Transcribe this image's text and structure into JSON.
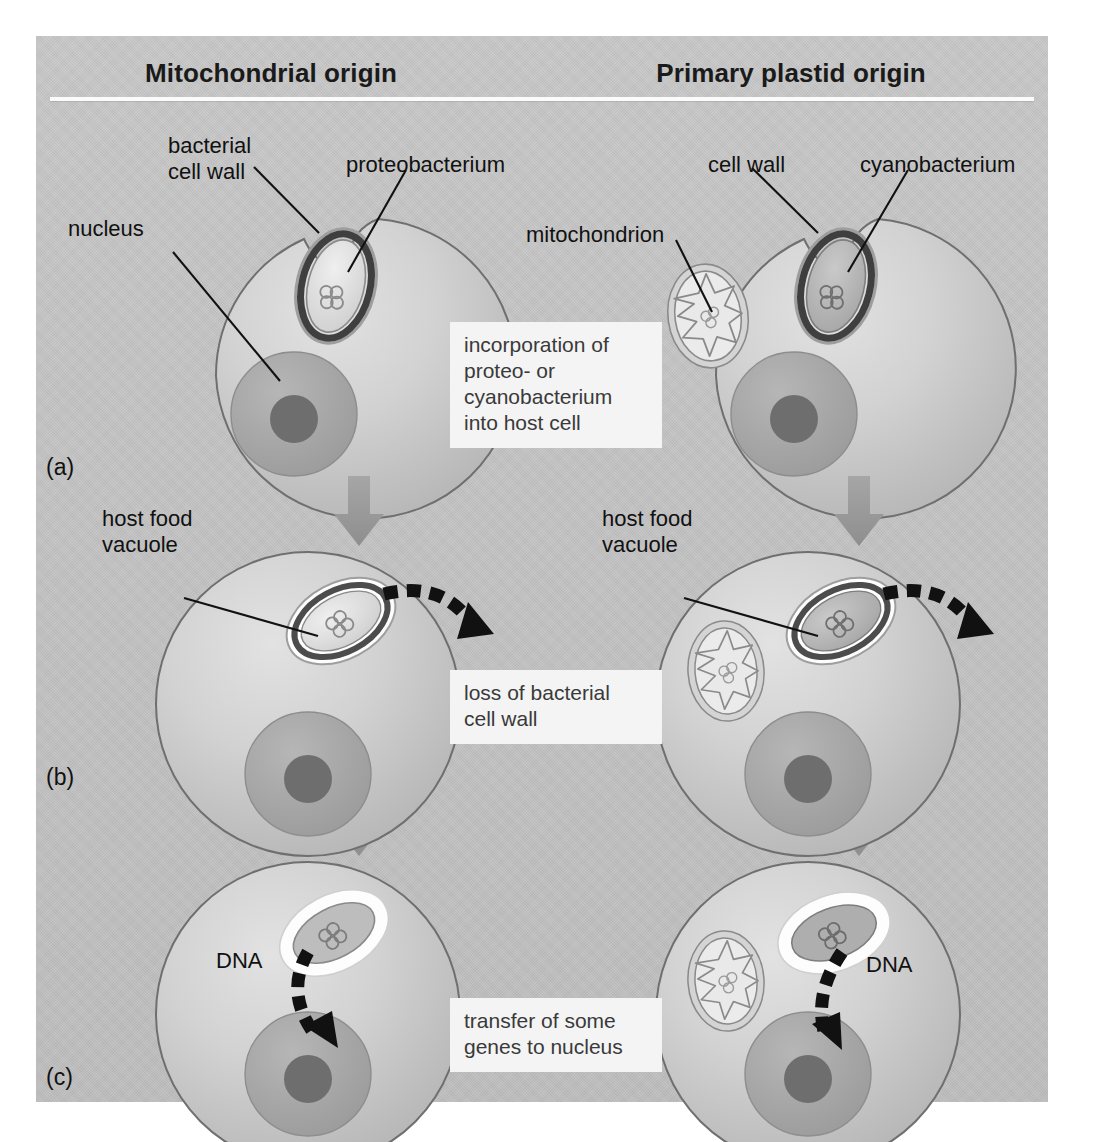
{
  "figure": {
    "title_left": "Mitochondrial origin",
    "title_right": "Primary plastid origin"
  },
  "rows": [
    {
      "id": "a",
      "label": "(a)",
      "caption": "incorporation of\nproteo- or\ncyanobacterium\ninto host cell"
    },
    {
      "id": "b",
      "label": "(b)",
      "caption": "loss of bacterial\ncell wall"
    },
    {
      "id": "c",
      "label": "(c)",
      "caption": "transfer of some\ngenes to nucleus"
    }
  ],
  "labels": {
    "bacterial_cell_wall": "bacterial\ncell wall",
    "proteobacterium": "proteobacterium",
    "nucleus": "nucleus",
    "cell_wall": "cell wall",
    "cyanobacterium": "cyanobacterium",
    "mitochondrion": "mitochondrion",
    "host_food_vacuole_left": "host food\nvacuole",
    "host_food_vacuole_right": "host food\nvacuole",
    "dna_left": "DNA",
    "dna_right": "DNA"
  },
  "colors": {
    "panel_background": "#c3c3c3",
    "page_background": "#ffffff",
    "rule": "#fbfbfb",
    "caption_box": "#f4f4f4",
    "caption_text": "#3a3a3a",
    "label_text": "#111111",
    "cell_fill_light": "#d8d8d8",
    "cell_fill_mid": "#c0c0c0",
    "cell_outline": "#6f6f6f",
    "nucleus_fill": "#a9a9a9",
    "nucleolus_fill": "#6e6e6e",
    "bacterial_wall": "#4a4a4a",
    "vacuole_white": "#fdfdfd",
    "arrow_gray": "#9a9a9a",
    "dna_arrow_black": "#111111"
  },
  "stage_arrows": {
    "count": 4,
    "direction": "down",
    "color": "#9a9a9a"
  },
  "dashed_arrows": {
    "row_b_left": "outward from engulfed bacterium",
    "row_b_right": "outward from engulfed bacterium",
    "row_c_left": "from organelle to nucleus",
    "row_c_right": "from organelle to nucleus"
  }
}
